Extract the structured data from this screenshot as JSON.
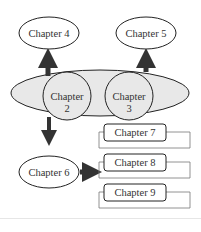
{
  "diagram": {
    "type": "chapter-flow",
    "nodes": {
      "chapter4": {
        "label": "Chapter 4",
        "shape": "ellipse"
      },
      "chapter5": {
        "label": "Chapter 5",
        "shape": "ellipse"
      },
      "chapter2": {
        "label_line1": "Chapter",
        "label_line2": "2",
        "shape": "circle"
      },
      "chapter3": {
        "label_line1": "Chapter",
        "label_line2": "3",
        "shape": "circle"
      },
      "chapter6": {
        "label": "Chapter 6",
        "shape": "ellipse"
      },
      "chapter7": {
        "label": "Chapter 7",
        "shape": "rounded-box"
      },
      "chapter8": {
        "label": "Chapter 8",
        "shape": "rounded-box"
      },
      "chapter9": {
        "label": "Chapter 9",
        "shape": "rounded-box"
      }
    },
    "group": {
      "name": "core-group",
      "members": [
        "chapter2",
        "chapter3"
      ],
      "fill": "#e8e8e8"
    },
    "edges": [
      {
        "from": "core-group",
        "to": "chapter4"
      },
      {
        "from": "core-group",
        "to": "chapter5"
      },
      {
        "from": "core-group",
        "to": "chapter6"
      },
      {
        "from": "chapter6",
        "to": "chapter8"
      }
    ],
    "colors": {
      "stroke": "#222222",
      "arrow": "#333333",
      "group_fill": "#e8e8e8",
      "text": "#333333"
    }
  }
}
